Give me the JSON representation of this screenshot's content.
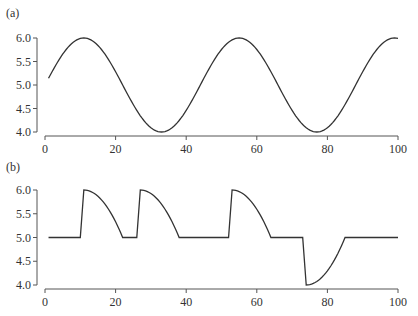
{
  "chart_data": [
    {
      "type": "line",
      "panel_label": "(a)",
      "title": "",
      "xlabel": "",
      "ylabel": "",
      "xlim": [
        0,
        100
      ],
      "ylim": [
        4.0,
        6.0
      ],
      "x_ticks": [
        "0",
        "20",
        "40",
        "60",
        "80",
        "100"
      ],
      "y_ticks": [
        "6.0",
        "5.5",
        "5.0",
        "4.5",
        "4.0"
      ],
      "grid": false,
      "description": "Sinusoid y = 5 + sin(2*pi*(x - 0)/44 ...) with peaks near x=11 and x=55, troughs near x=33 and x=77, period ~44",
      "series": [
        {
          "name": "sine",
          "x": [
            1,
            5,
            11,
            17,
            22,
            28,
            33,
            39,
            44,
            50,
            55,
            61,
            66,
            72,
            77,
            83,
            88,
            94,
            99,
            100
          ],
          "values": [
            5.14,
            5.62,
            6.0,
            5.71,
            5.0,
            4.29,
            4.0,
            4.29,
            5.0,
            5.71,
            6.0,
            5.71,
            5.0,
            4.29,
            4.0,
            4.29,
            5.0,
            5.71,
            6.0,
            5.99
          ]
        }
      ]
    },
    {
      "type": "line",
      "panel_label": "(b)",
      "title": "",
      "xlabel": "",
      "ylabel": "",
      "xlim": [
        0,
        100
      ],
      "ylim": [
        4.0,
        6.0
      ],
      "x_ticks": [
        "0",
        "20",
        "40",
        "60",
        "80",
        "100"
      ],
      "y_ticks": [
        "6.0",
        "5.5",
        "5.0",
        "4.5",
        "4.0"
      ],
      "grid": false,
      "description": "Piecewise signal at 5.0 with three positive pulses (jump to 6.0 then concave decay back to 5.0) and one negative pulse (drop to 4.0 then recovery to 5.0)",
      "series": [
        {
          "name": "pulses",
          "x": [
            1,
            10,
            11,
            22,
            26,
            27,
            38,
            52,
            53,
            64,
            73,
            74,
            85,
            100
          ],
          "values": [
            5.0,
            5.0,
            6.0,
            5.0,
            5.0,
            6.0,
            5.0,
            5.0,
            6.0,
            5.0,
            5.0,
            4.0,
            5.0,
            5.0
          ]
        }
      ]
    }
  ]
}
